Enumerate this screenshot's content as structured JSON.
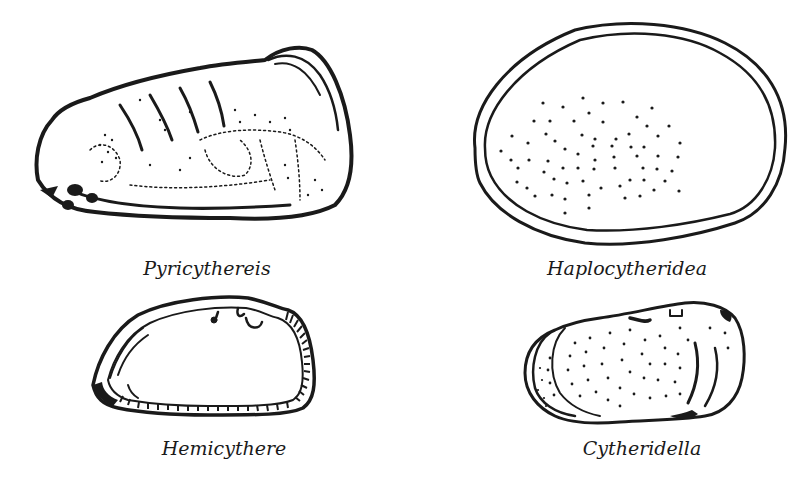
{
  "figure": {
    "colors": {
      "ink": "#1a1a1a",
      "background": "#ffffff"
    },
    "specimens": [
      {
        "id": "pyricythereis",
        "label": "Pyricythereis",
        "position": "top-left",
        "style": "reticulate-ornamented-carapace"
      },
      {
        "id": "haplocytheridea",
        "label": "Haplocytheridea",
        "position": "top-right",
        "style": "smooth-oval-punctate"
      },
      {
        "id": "hemicythere",
        "label": "Hemicythere",
        "position": "bottom-left",
        "style": "hatched-margin-carapace"
      },
      {
        "id": "cytheridella",
        "label": "Cytheridella",
        "position": "bottom-right",
        "style": "concentric-punctate"
      }
    ]
  }
}
